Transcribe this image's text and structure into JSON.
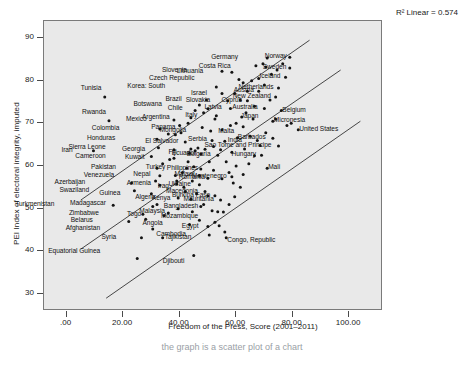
{
  "chart_data": {
    "type": "scatter",
    "title": "",
    "xlabel": "Freedom of the Press, Score (2001–2011)",
    "ylabel": "PEI Index of electoral integrity, imputed",
    "xlim": [
      -8,
      112
    ],
    "ylim": [
      26,
      94
    ],
    "xticks": [
      ".00",
      "20.00",
      "40.00",
      "60.00",
      "80.00",
      "100.00"
    ],
    "xtick_values": [
      0,
      20,
      40,
      60,
      80,
      100
    ],
    "yticks": [
      "30",
      "40",
      "50",
      "60",
      "70",
      "80",
      "90"
    ],
    "ytick_values": [
      30,
      40,
      50,
      60,
      70,
      80,
      90
    ],
    "grid": false,
    "legend": "none",
    "annotation": "R² Linear = 0.574",
    "r_squared": 0.574,
    "fit_line": {
      "x0": 5,
      "y0": 40.5,
      "x1": 97,
      "y1": 82.5
    },
    "band_upper": {
      "x0": 5,
      "y0": 52.0,
      "x1": 86,
      "y1": 89.5
    },
    "band_lower": {
      "x0": 14,
      "y0": 29.0,
      "x1": 104,
      "y1": 70.5
    },
    "points": [
      {
        "label": "Tunisia",
        "x": 13.5,
        "y": 76.2,
        "lx": -2,
        "ly": -9
      },
      {
        "label": "Rwanda",
        "x": 15.0,
        "y": 70.6,
        "lx": -2,
        "ly": -9
      },
      {
        "label": "Iran",
        "x": 9.5,
        "y": 63.6,
        "lx": -20,
        "ly": -1
      },
      {
        "label": "Colombia",
        "x": 33.0,
        "y": 68.7,
        "lx": -40,
        "ly": -1
      },
      {
        "label": "Honduras",
        "x": 32.0,
        "y": 66.3,
        "lx": -41,
        "ly": -1
      },
      {
        "label": "Sierra Leone",
        "x": 32.5,
        "y": 64.3,
        "lx": -52,
        "ly": -1
      },
      {
        "label": "Cameroon",
        "x": 30.0,
        "y": 62.2,
        "lx": -45,
        "ly": -1
      },
      {
        "label": "Pakistan",
        "x": 32.0,
        "y": 59.5,
        "lx": -40,
        "ly": -1
      },
      {
        "label": "Venezuela",
        "x": 33.0,
        "y": 57.7,
        "lx": -45,
        "ly": -1
      },
      {
        "label": "Azerbaijan",
        "x": 23.0,
        "y": 56.0,
        "lx": -45,
        "ly": -1
      },
      {
        "label": "Swaziland",
        "x": 24.0,
        "y": 54.2,
        "lx": -44,
        "ly": -1
      },
      {
        "label": "Guinea",
        "x": 30.0,
        "y": 53.5,
        "lx": -30,
        "ly": -1
      },
      {
        "label": "Turkmenistan",
        "x": 16.5,
        "y": 50.8,
        "lx": -58,
        "ly": -1
      },
      {
        "label": "Madagascar",
        "x": 32.0,
        "y": 51.0,
        "lx": -50,
        "ly": -1
      },
      {
        "label": "Zimbabwe",
        "x": 27.0,
        "y": 48.7,
        "lx": -43,
        "ly": -1
      },
      {
        "label": "Belarus",
        "x": 22.0,
        "y": 47.0,
        "lx": -35,
        "ly": -1
      },
      {
        "label": "Togo",
        "x": 34.5,
        "y": 48.4,
        "lx": -22,
        "ly": -1
      },
      {
        "label": "Afghanistan",
        "x": 30.5,
        "y": 45.2,
        "lx": -52,
        "ly": -1
      },
      {
        "label": "Syria",
        "x": 26.5,
        "y": 43.2,
        "lx": -24,
        "ly": -1
      },
      {
        "label": "Tajikistan",
        "x": 34.0,
        "y": 43.2,
        "lx": 3,
        "ly": -1
      },
      {
        "label": "Equatorial Guinea",
        "x": 25.0,
        "y": 38.3,
        "lx": -36,
        "ly": -8
      },
      {
        "label": "Djibouti",
        "x": 45.0,
        "y": 39.0,
        "lx": -8,
        "ly": 5
      },
      {
        "label": "Angola",
        "x": 43.5,
        "y": 46.3,
        "lx": -26,
        "ly": -1
      },
      {
        "label": "Egypt",
        "x": 50.0,
        "y": 45.8,
        "lx": -8,
        "ly": -1
      },
      {
        "label": "Cambodia",
        "x": 50.5,
        "y": 43.8,
        "lx": -22,
        "ly": -1
      },
      {
        "label": "Congo, Republic",
        "x": 56.5,
        "y": 43.2,
        "lx": 2,
        "ly": 2
      },
      {
        "label": "Malaysia",
        "x": 44.5,
        "y": 49.3,
        "lx": -26,
        "ly": -1
      },
      {
        "label": "Mozambique",
        "x": 52.5,
        "y": 46.8,
        "lx": -16,
        "ly": -6
      },
      {
        "label": "Bangladesh",
        "x": 47.5,
        "y": 50.5,
        "lx": -2,
        "ly": -1
      },
      {
        "label": "Mauritania",
        "x": 54.5,
        "y": 52.0,
        "lx": -6,
        "ly": -1
      },
      {
        "label": "Kenya",
        "x": 44.0,
        "y": 52.2,
        "lx": -20,
        "ly": -1
      },
      {
        "label": "Algeria",
        "x": 39.5,
        "y": 52.5,
        "lx": -22,
        "ly": -1
      },
      {
        "label": "Iraq",
        "x": 41.5,
        "y": 55.0,
        "lx": -14,
        "ly": -1
      },
      {
        "label": "Armenia",
        "x": 39.0,
        "y": 55.8,
        "lx": -25,
        "ly": -1
      },
      {
        "label": "Nepal",
        "x": 38.5,
        "y": 57.8,
        "lx": -24,
        "ly": -1
      },
      {
        "label": "Malawi",
        "x": 47.0,
        "y": 57.8,
        "lx": -4,
        "ly": -1
      },
      {
        "label": "Ukraine",
        "x": 47.0,
        "y": 55.6,
        "lx": -8,
        "ly": -1
      },
      {
        "label": "Macedonia",
        "x": 49.0,
        "y": 54.0,
        "lx": -6,
        "ly": -1
      },
      {
        "label": "Burkina Faso",
        "x": 52.5,
        "y": 53.0,
        "lx": -4,
        "ly": -1
      },
      {
        "label": "Turkey",
        "x": 42.5,
        "y": 59.5,
        "lx": -20,
        "ly": -1
      },
      {
        "label": "Philippines",
        "x": 47.5,
        "y": 59.3,
        "lx": -2,
        "ly": -1
      },
      {
        "label": "Romania",
        "x": 50.0,
        "y": 57.1,
        "lx": -2,
        "ly": -1
      },
      {
        "label": "Montenegro",
        "x": 58.5,
        "y": 57.5,
        "lx": -4,
        "ly": -1
      },
      {
        "label": "Kuwait",
        "x": 38.0,
        "y": 61.8,
        "lx": -28,
        "ly": -1
      },
      {
        "label": "Fiji",
        "x": 43.5,
        "y": 63.0,
        "lx": -12,
        "ly": -1
      },
      {
        "label": "Georgia",
        "x": 38.0,
        "y": 63.8,
        "lx": -28,
        "ly": -1
      },
      {
        "label": "Ecuador",
        "x": 47.5,
        "y": 62.8,
        "lx": -4,
        "ly": -1
      },
      {
        "label": "El Salvador",
        "x": 42.0,
        "y": 65.6,
        "lx": -6,
        "ly": -1
      },
      {
        "label": "Serbia",
        "x": 51.5,
        "y": 66.0,
        "lx": -4,
        "ly": -1
      },
      {
        "label": "Bulgaria",
        "x": 53.5,
        "y": 62.5,
        "lx": -6,
        "ly": -1
      },
      {
        "label": "India",
        "x": 56.0,
        "y": 65.8,
        "lx": 4,
        "ly": -1
      },
      {
        "label": "Mongolia",
        "x": 51.0,
        "y": 68.2,
        "lx": -24,
        "ly": -1
      },
      {
        "label": "Panama",
        "x": 48.0,
        "y": 69.0,
        "lx": -26,
        "ly": -1
      },
      {
        "label": "Mexico",
        "x": 38.0,
        "y": 70.8,
        "lx": -26,
        "ly": -1
      },
      {
        "label": "Argentina",
        "x": 44.0,
        "y": 71.3,
        "lx": -20,
        "ly": -1
      },
      {
        "label": "Chile",
        "x": 50.0,
        "y": 73.4,
        "lx": -24,
        "ly": -1
      },
      {
        "label": "Botswana",
        "x": 47.0,
        "y": 74.3,
        "lx": -36,
        "ly": -1
      },
      {
        "label": "Brazil",
        "x": 49.5,
        "y": 75.5,
        "lx": -24,
        "ly": -1
      },
      {
        "label": "Italy",
        "x": 53.0,
        "y": 71.8,
        "lx": -18,
        "ly": -1
      },
      {
        "label": "Japan",
        "x": 62.0,
        "y": 71.5,
        "lx": 0,
        "ly": -1
      },
      {
        "label": "Malta",
        "x": 62.5,
        "y": 69.2,
        "lx": -8,
        "ly": 4
      },
      {
        "label": "Latvia",
        "x": 58.0,
        "y": 73.5,
        "lx": -8,
        "ly": -1
      },
      {
        "label": "Israel",
        "x": 55.0,
        "y": 77.0,
        "lx": -14,
        "ly": -1
      },
      {
        "label": "Slovakia",
        "x": 57.0,
        "y": 75.3,
        "lx": -16,
        "ly": -1
      },
      {
        "label": "Cyprus",
        "x": 64.0,
        "y": 75.3,
        "lx": -4,
        "ly": -1
      },
      {
        "label": "Korea: South",
        "x": 53.0,
        "y": 78.5,
        "lx": -50,
        "ly": -1
      },
      {
        "label": "Czech Republic",
        "x": 61.0,
        "y": 80.3,
        "lx": -44,
        "ly": -1
      },
      {
        "label": "Lithuania",
        "x": 58.5,
        "y": 82.0,
        "lx": -28,
        "ly": -1
      },
      {
        "label": "Slovenia",
        "x": 55.0,
        "y": 82.2,
        "lx": -34,
        "ly": -1
      },
      {
        "label": "Austria",
        "x": 68.0,
        "y": 77.5,
        "lx": -4,
        "ly": -1
      },
      {
        "label": "Australia",
        "x": 70.0,
        "y": 73.5,
        "lx": -6,
        "ly": -1
      },
      {
        "label": "Belgium",
        "x": 76.0,
        "y": 73.0,
        "lx": 2,
        "ly": -1
      },
      {
        "label": "New Zealand",
        "x": 74.0,
        "y": 76.2,
        "lx": -4,
        "ly": -1
      },
      {
        "label": "Netherlands",
        "x": 75.0,
        "y": 78.3,
        "lx": -4,
        "ly": -1
      },
      {
        "label": "Iceland",
        "x": 77.5,
        "y": 80.8,
        "lx": -4,
        "ly": -1
      },
      {
        "label": "Costa Rica",
        "x": 70.5,
        "y": 83.2,
        "lx": -34,
        "ly": -1
      },
      {
        "label": "Sweden",
        "x": 79.0,
        "y": 83.0,
        "lx": -2,
        "ly": -1
      },
      {
        "label": "Germany",
        "x": 71.0,
        "y": 85.3,
        "lx": -28,
        "ly": -1
      },
      {
        "label": "Norway",
        "x": 79.0,
        "y": 85.5,
        "lx": -2,
        "ly": -1
      },
      {
        "label": "Micronesia",
        "x": 73.0,
        "y": 70.5,
        "lx": 2,
        "ly": -1
      },
      {
        "label": "United States",
        "x": 82.0,
        "y": 68.5,
        "lx": 2,
        "ly": -1
      },
      {
        "label": "Barbados",
        "x": 73.0,
        "y": 66.5,
        "lx": -6,
        "ly": -1
      },
      {
        "label": "Sao Tome and Principe",
        "x": 75.0,
        "y": 64.7,
        "lx": -6,
        "ly": -1
      },
      {
        "label": "Hungary",
        "x": 69.0,
        "y": 62.5,
        "lx": -4,
        "ly": -1
      },
      {
        "label": "Mali",
        "x": 71.0,
        "y": 59.5,
        "lx": 2,
        "ly": -1
      }
    ],
    "extra_points": [
      {
        "x": 36.0,
        "y": 67.5
      },
      {
        "x": 38.5,
        "y": 67.3
      },
      {
        "x": 40.5,
        "y": 67.8
      },
      {
        "x": 44.0,
        "y": 64.0
      },
      {
        "x": 45.5,
        "y": 63.6
      },
      {
        "x": 46.5,
        "y": 64.2
      },
      {
        "x": 49.0,
        "y": 63.9
      },
      {
        "x": 52.0,
        "y": 64.6
      },
      {
        "x": 54.5,
        "y": 63.8
      },
      {
        "x": 56.5,
        "y": 61.0
      },
      {
        "x": 58.5,
        "y": 63.2
      },
      {
        "x": 60.5,
        "y": 66.6
      },
      {
        "x": 63.0,
        "y": 64.0
      },
      {
        "x": 65.0,
        "y": 67.0
      },
      {
        "x": 66.5,
        "y": 62.4
      },
      {
        "x": 68.5,
        "y": 64.8
      },
      {
        "x": 57.5,
        "y": 58.5
      },
      {
        "x": 60.0,
        "y": 60.0
      },
      {
        "x": 62.5,
        "y": 58.0
      },
      {
        "x": 55.0,
        "y": 57.0
      },
      {
        "x": 52.0,
        "y": 59.0
      },
      {
        "x": 50.5,
        "y": 61.0
      },
      {
        "x": 45.0,
        "y": 59.8
      },
      {
        "x": 43.0,
        "y": 61.0
      },
      {
        "x": 41.0,
        "y": 58.5
      },
      {
        "x": 36.5,
        "y": 61.5
      },
      {
        "x": 34.0,
        "y": 60.5
      },
      {
        "x": 46.0,
        "y": 53.5
      },
      {
        "x": 48.5,
        "y": 51.0
      },
      {
        "x": 51.5,
        "y": 49.5
      },
      {
        "x": 53.5,
        "y": 49.3
      },
      {
        "x": 55.5,
        "y": 49.2
      },
      {
        "x": 57.5,
        "y": 51.0
      },
      {
        "x": 59.5,
        "y": 52.8
      },
      {
        "x": 61.5,
        "y": 55.0
      },
      {
        "x": 47.0,
        "y": 47.3
      },
      {
        "x": 54.0,
        "y": 46.0
      },
      {
        "x": 56.0,
        "y": 44.5
      },
      {
        "x": 39.5,
        "y": 50.0
      },
      {
        "x": 36.0,
        "y": 49.0
      },
      {
        "x": 30.5,
        "y": 50.5
      },
      {
        "x": 28.0,
        "y": 47.5
      },
      {
        "x": 55.0,
        "y": 68.5
      },
      {
        "x": 58.0,
        "y": 69.5
      },
      {
        "x": 60.0,
        "y": 70.0
      },
      {
        "x": 63.5,
        "y": 72.5
      },
      {
        "x": 66.0,
        "y": 71.0
      },
      {
        "x": 66.5,
        "y": 74.0
      },
      {
        "x": 61.5,
        "y": 75.5
      },
      {
        "x": 64.0,
        "y": 77.5
      },
      {
        "x": 59.5,
        "y": 77.0
      },
      {
        "x": 62.5,
        "y": 79.5
      },
      {
        "x": 65.5,
        "y": 80.0
      },
      {
        "x": 68.0,
        "y": 80.5
      },
      {
        "x": 70.0,
        "y": 79.0
      },
      {
        "x": 72.5,
        "y": 81.5
      },
      {
        "x": 74.5,
        "y": 82.5
      },
      {
        "x": 67.0,
        "y": 83.5
      },
      {
        "x": 69.5,
        "y": 84.0
      },
      {
        "x": 76.5,
        "y": 84.0
      },
      {
        "x": 72.0,
        "y": 75.5
      },
      {
        "x": 74.0,
        "y": 71.0
      },
      {
        "x": 78.0,
        "y": 69.5
      },
      {
        "x": 79.5,
        "y": 70.0
      },
      {
        "x": 70.5,
        "y": 67.8
      },
      {
        "x": 67.5,
        "y": 66.0
      },
      {
        "x": 64.5,
        "y": 60.5
      },
      {
        "x": 59.0,
        "y": 56.0
      },
      {
        "x": 50.0,
        "y": 53.0
      },
      {
        "x": 44.5,
        "y": 56.5
      },
      {
        "x": 42.0,
        "y": 54.0
      },
      {
        "x": 39.0,
        "y": 56.5
      },
      {
        "x": 33.0,
        "y": 55.5
      },
      {
        "x": 31.5,
        "y": 56.5
      },
      {
        "x": 52.5,
        "y": 71.0
      },
      {
        "x": 48.5,
        "y": 72.5
      },
      {
        "x": 45.5,
        "y": 73.0
      },
      {
        "x": 43.0,
        "y": 70.0
      },
      {
        "x": 40.0,
        "y": 69.5
      }
    ]
  },
  "caption": "the graph is a scatter plot of a chart"
}
